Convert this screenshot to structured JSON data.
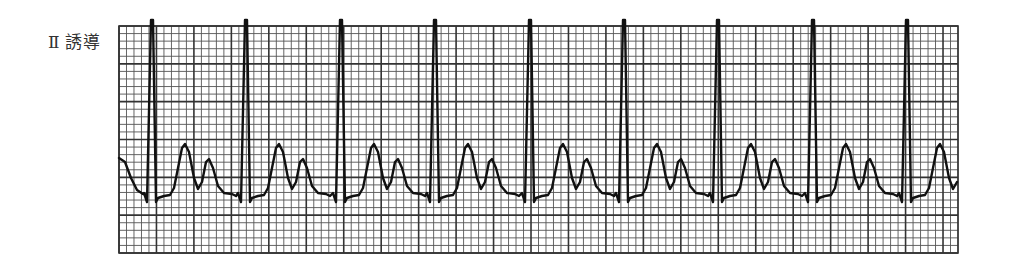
{
  "label": {
    "roman": "Ⅱ",
    "text": "誘導"
  },
  "grid": {
    "x0": 119,
    "y0": 26,
    "x1": 958,
    "y1": 253,
    "small_cell_px": 7.5,
    "major_every": 5,
    "minor_color": "#555555",
    "major_color": "#333333"
  },
  "trace": {
    "color": "#111111",
    "baseline_y": 192,
    "r_peak_y": 20,
    "r_peaks_x": [
      152,
      246,
      341,
      435,
      530,
      624,
      718,
      813,
      907
    ],
    "rr_interval_px": 94.4
  },
  "chart_data": {
    "type": "line",
    "title": "Ⅱ誘導",
    "beats": 9,
    "rr_interval_small_boxes": 12.6,
    "xlabel": "",
    "ylabel": "",
    "grid": true
  }
}
